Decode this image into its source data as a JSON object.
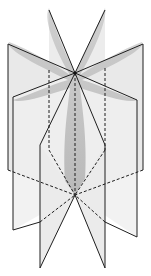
{
  "figure": {
    "colors": {
      "background": "#ffffff",
      "plane_fill": "#e6e6e6",
      "plane_fill_light": "#efefef",
      "object_fill": "#a8a8a8",
      "edge": "#1e1e1e"
    },
    "axis": {
      "top_point": [
        75,
        73
      ],
      "bottom_point": [
        75,
        195
      ]
    },
    "planes": [
      {
        "name": "back-plane",
        "tips": [
          [
            49,
            10
          ],
          [
            105,
            10
          ]
        ]
      },
      {
        "name": "left-plane",
        "outer_edge": [
          [
            8,
            44
          ],
          [
            13,
            218
          ]
        ]
      },
      {
        "name": "right-plane",
        "outer_edge": [
          [
            143,
            44
          ],
          [
            137,
            225
          ]
        ]
      },
      {
        "name": "front-plane",
        "tips": [
          [
            40,
            268
          ],
          [
            105,
            268
          ]
        ]
      }
    ]
  }
}
